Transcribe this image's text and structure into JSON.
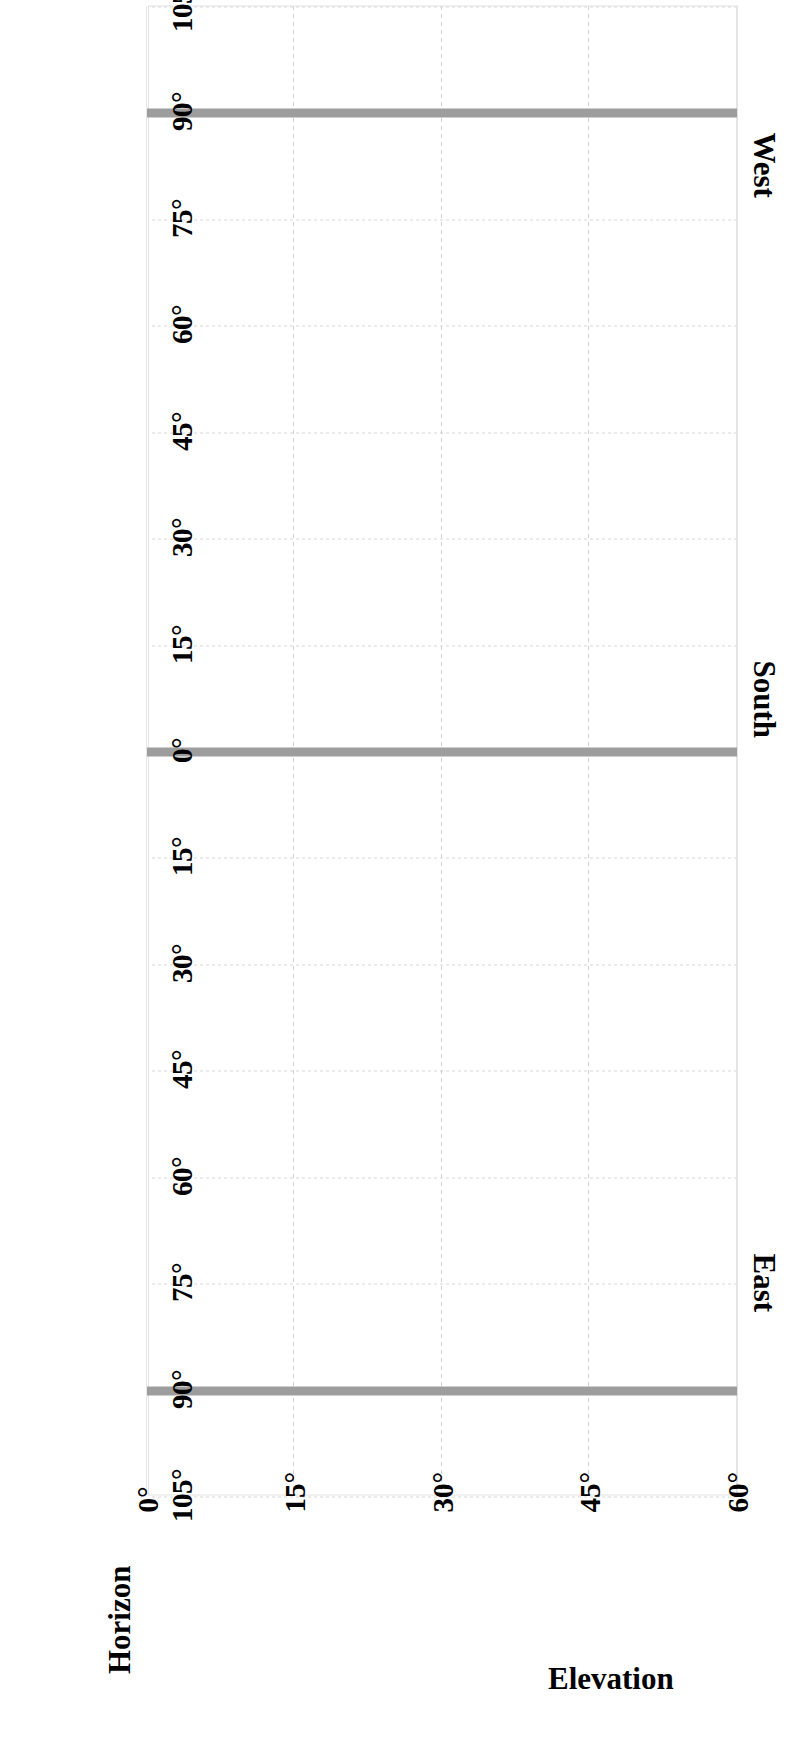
{
  "figure": {
    "kind": "sun-path-diagram",
    "background_color": "#ffffff",
    "trace_color": "#9d9d9d",
    "grid_color": "#d8d8d8",
    "rotation_note_degrees": 90
  },
  "captions": {
    "west": "West",
    "south": "South",
    "east": "East",
    "horizon": "Horizon",
    "elevation": "Elevation"
  },
  "chart_data": {
    "type": "line",
    "title": "",
    "xlabel": "Horizon",
    "ylabel": "Elevation",
    "xlim": [
      -105,
      105
    ],
    "ylim": [
      0,
      60
    ],
    "grid": true,
    "legend": "none",
    "x_tick_values": [
      -105,
      -90,
      -75,
      -60,
      -45,
      -30,
      -15,
      0,
      15,
      30,
      45,
      60,
      75,
      90,
      105
    ],
    "x_tick_labels": [
      "105°",
      "90°",
      "75°",
      "60°",
      "45°",
      "30°",
      "15°",
      "0°",
      "15°",
      "30°",
      "45°",
      "60°",
      "75°",
      "90°",
      "105°"
    ],
    "y_tick_values": [
      60,
      45,
      30,
      15,
      0
    ],
    "y_tick_labels": [
      "60°",
      "45°",
      "30°",
      "15°",
      "0°"
    ],
    "region_labels": [
      {
        "label": "West",
        "x": -90
      },
      {
        "label": "South",
        "x": 0
      },
      {
        "label": "East",
        "x": 90
      }
    ],
    "series": [
      {
        "name": "West vertical trace",
        "x": -90,
        "y_from": 0,
        "y_to": 60,
        "orientation": "vertical"
      },
      {
        "name": "South vertical trace",
        "x": 0,
        "y_from": 0,
        "y_to": 60,
        "orientation": "vertical"
      },
      {
        "name": "East vertical trace",
        "x": 90,
        "y_from": 0,
        "y_to": 60,
        "orientation": "vertical"
      }
    ]
  }
}
